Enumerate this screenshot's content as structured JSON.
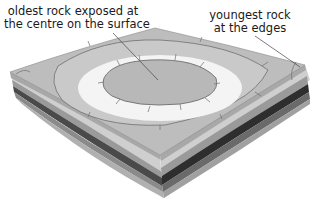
{
  "diagram": {
    "type": "geological block diagram (dome)",
    "labels": [
      {
        "id": "oldest",
        "lines": [
          "oldest rock exposed at",
          "the centre on the surface"
        ]
      },
      {
        "id": "youngest",
        "lines": [
          "youngest rock",
          "at the edges"
        ]
      }
    ],
    "colors": {
      "outer_surface": "#bdbdbd",
      "middle_band": "#c9c9c9",
      "white_band": "#f4f4f4",
      "inner_core": "#b8b8b8",
      "outcrop_line": "#6e6e6e",
      "layer_light": "#cfcfcf",
      "layer_mid": "#9a9a9a",
      "layer_dark": "#4a4a4a",
      "layer_darkest": "#2e2e2e",
      "leader_line": "#444444"
    }
  }
}
